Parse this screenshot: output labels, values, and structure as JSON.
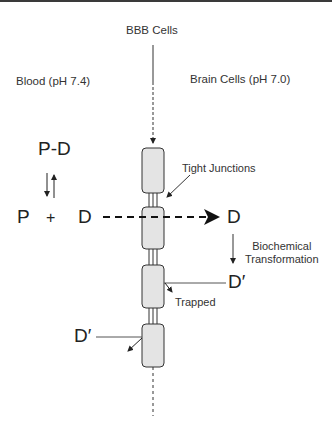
{
  "diagram": {
    "title_top": "BBB Cells",
    "left_region": "Blood (pH 7.4)",
    "right_region": "Brain Cells (pH 7.0)",
    "complex": "P-D",
    "protein": "P",
    "plus": "+",
    "drug_left": "D",
    "drug_right": "D",
    "metabolite_right": "D′",
    "metabolite_left": "D′",
    "tight_junctions": "Tight Junctions",
    "biochem_line1": "Biochemical",
    "biochem_line2": "Transformation",
    "trapped": "Trapped"
  },
  "colors": {
    "cell_fill": "#e4e4e4",
    "stroke": "#333333",
    "border_top": "#3a3a3a"
  }
}
